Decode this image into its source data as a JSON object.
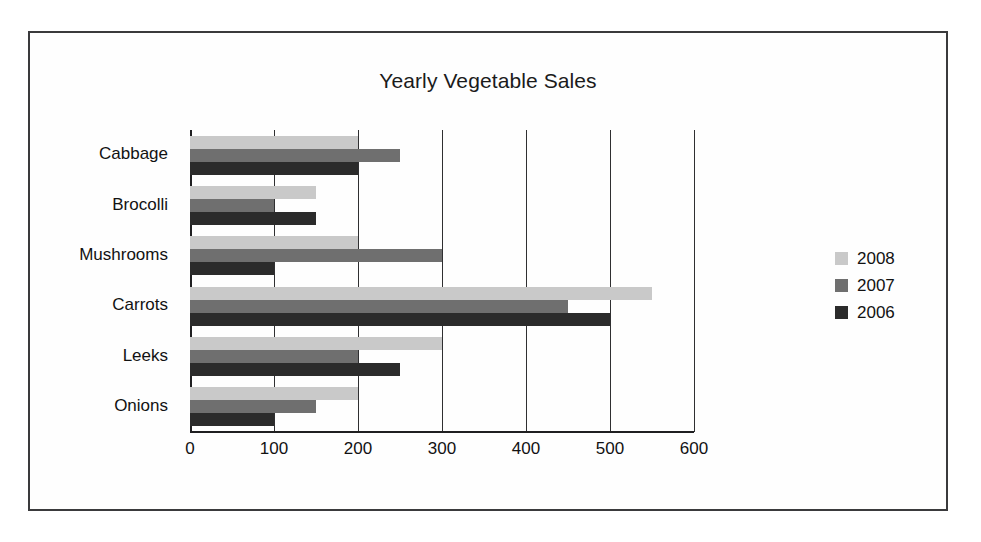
{
  "chart_data": {
    "type": "bar",
    "orientation": "horizontal",
    "title": "Yearly Vegetable Sales",
    "xlabel": "",
    "ylabel": "",
    "categories": [
      "Cabbage",
      "Brocolli",
      "Mushrooms",
      "Carrots",
      "Leeks",
      "Onions"
    ],
    "series": [
      {
        "name": "2008",
        "color": "#c9c9c9",
        "values": [
          200,
          150,
          200,
          550,
          300,
          200
        ]
      },
      {
        "name": "2007",
        "color": "#6f6f6f",
        "values": [
          250,
          100,
          300,
          450,
          200,
          150
        ]
      },
      {
        "name": "2006",
        "color": "#2b2b2b",
        "values": [
          200,
          150,
          100,
          500,
          250,
          100
        ]
      }
    ],
    "xlim": [
      0,
      600
    ],
    "xticks": [
      "0",
      "100",
      "200",
      "300",
      "400",
      "500",
      "600"
    ],
    "xtick_values": [
      0,
      100,
      200,
      300,
      400,
      500,
      600
    ],
    "grid": true,
    "grid_axis": "x",
    "legend_position": "right",
    "legend": [
      "2008",
      "2007",
      "2006"
    ]
  },
  "frame": {
    "border_color": "#3a3a3c",
    "background": "#fefefe"
  }
}
